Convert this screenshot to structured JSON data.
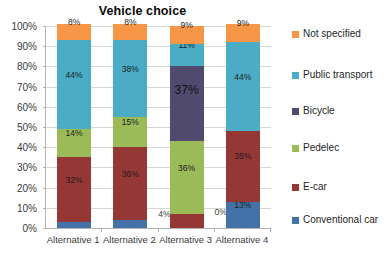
{
  "chart_data": {
    "type": "bar",
    "subtype": "stacked-percent-column",
    "title": "Vehicle choice",
    "xlabel": "",
    "ylabel": "",
    "ylim": [
      0,
      100
    ],
    "ytick_labels": [
      "0%",
      "10%",
      "20%",
      "30%",
      "40%",
      "50%",
      "60%",
      "70%",
      "80%",
      "90%",
      "100%"
    ],
    "ytick_values": [
      0,
      10,
      20,
      30,
      40,
      50,
      60,
      70,
      80,
      90,
      100
    ],
    "grid": true,
    "legend_position": "right",
    "categories": [
      "Alternative 1",
      "Alternative 2",
      "Alternative 3",
      "Alternative 4"
    ],
    "series": [
      {
        "name": "Conventional car",
        "color": "#4472A8",
        "values": [
          3,
          4,
          0,
          13
        ],
        "labels": [
          "3%",
          "4%",
          "0%",
          "13%"
        ]
      },
      {
        "name": "E-car",
        "color": "#953735",
        "values": [
          32,
          36,
          7,
          35
        ],
        "labels": [
          "32%",
          "36%",
          "7%",
          "35%"
        ]
      },
      {
        "name": "Pedelec",
        "color": "#9BBB59",
        "values": [
          14,
          15,
          36,
          0
        ],
        "labels": [
          "14%",
          "15%",
          "36%",
          ""
        ]
      },
      {
        "name": "Bicycle",
        "color": "#4F4A6E",
        "values": [
          0,
          0,
          37,
          0
        ],
        "labels": [
          "",
          "",
          "37%",
          ""
        ]
      },
      {
        "name": "Public transport",
        "color": "#4BACC6",
        "values": [
          44,
          38,
          11,
          44
        ],
        "labels": [
          "44%",
          "38%",
          "11%",
          "44%"
        ]
      },
      {
        "name": "Not specified",
        "color": "#F79646",
        "values": [
          8,
          8,
          9,
          9
        ],
        "labels": [
          "8%",
          "8%",
          "9%",
          "9%"
        ]
      }
    ],
    "legend_entries": [
      {
        "label": "Not specified",
        "color": "#F79646"
      },
      {
        "label": "Public transport",
        "color": "#4BACC6"
      },
      {
        "label": "Bicycle",
        "color": "#4F4A6E"
      },
      {
        "label": "Pedelec",
        "color": "#9BBB59"
      },
      {
        "label": "E-car",
        "color": "#953735"
      },
      {
        "label": "Conventional car",
        "color": "#4472A8"
      }
    ]
  },
  "colors": {
    "axis": "#b3b3b3",
    "grid": "#d6d6d6",
    "text": "#3b3b3b",
    "title": "#0a0a0a",
    "background": "#ffffff"
  }
}
